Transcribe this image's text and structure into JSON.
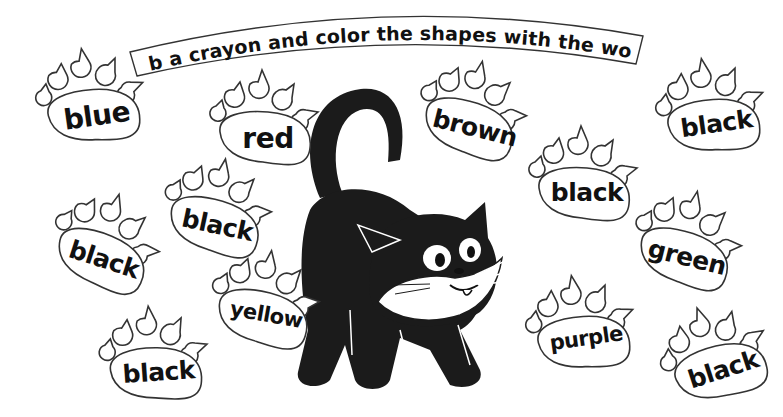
{
  "worksheet": {
    "instruction": "Grab a crayon and color the shapes with the word!",
    "paws": [
      {
        "id": "paw-blue",
        "word": "blue",
        "x": 25,
        "y": 48,
        "rot": -8
      },
      {
        "id": "paw-red",
        "word": "red",
        "x": 198,
        "y": 70,
        "rot": 0
      },
      {
        "id": "paw-black-1",
        "word": "black",
        "x": 150,
        "y": 158,
        "rot": 12
      },
      {
        "id": "paw-black-2",
        "word": "black",
        "x": 38,
        "y": 192,
        "rot": 18
      },
      {
        "id": "paw-yellow",
        "word": "yellow",
        "x": 198,
        "y": 250,
        "rot": 10
      },
      {
        "id": "paw-black-3",
        "word": "black",
        "x": 88,
        "y": 306,
        "rot": -4
      },
      {
        "id": "paw-brown",
        "word": "brown",
        "x": 405,
        "y": 60,
        "rot": 14
      },
      {
        "id": "paw-black-4",
        "word": "black",
        "x": 517,
        "y": 126,
        "rot": 0
      },
      {
        "id": "paw-black-5",
        "word": "black",
        "x": 645,
        "y": 58,
        "rot": -8
      },
      {
        "id": "paw-green",
        "word": "green",
        "x": 620,
        "y": 190,
        "rot": 14
      },
      {
        "id": "paw-purple",
        "word": "purple",
        "x": 515,
        "y": 275,
        "rot": -8
      },
      {
        "id": "paw-black-6",
        "word": "black",
        "x": 650,
        "y": 305,
        "rot": -18
      }
    ],
    "mascot": "black-cat",
    "colors": {
      "ink": "#111111",
      "paper": "#ffffff",
      "cat": "#1b1b1b"
    }
  }
}
